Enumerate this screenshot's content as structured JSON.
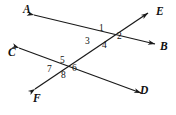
{
  "diagram": {
    "type": "geometry-two-transversal-intersections",
    "background_color": "#ffffff",
    "line_color": "#1a1a1a",
    "text_color": "#111111",
    "width": 176,
    "height": 115,
    "point_labels": [
      {
        "id": "A",
        "text": "A",
        "x": 23,
        "y": 4
      },
      {
        "id": "E",
        "text": "E",
        "x": 156,
        "y": 6
      },
      {
        "id": "B",
        "text": "B",
        "x": 160,
        "y": 41
      },
      {
        "id": "C",
        "text": "C",
        "x": 8,
        "y": 47
      },
      {
        "id": "F",
        "text": "F",
        "x": 33,
        "y": 93
      },
      {
        "id": "D",
        "text": "D",
        "x": 140,
        "y": 85
      }
    ],
    "angle_labels": [
      {
        "id": "1",
        "text": "1",
        "x": 99,
        "y": 24
      },
      {
        "id": "2",
        "text": "2",
        "x": 117,
        "y": 32
      },
      {
        "id": "3",
        "text": "3",
        "x": 85,
        "y": 37
      },
      {
        "id": "4",
        "text": "4",
        "x": 102,
        "y": 41
      },
      {
        "id": "5",
        "text": "5",
        "x": 60,
        "y": 56
      },
      {
        "id": "6",
        "text": "6",
        "x": 72,
        "y": 64
      },
      {
        "id": "7",
        "text": "7",
        "x": 47,
        "y": 65
      },
      {
        "id": "8",
        "text": "8",
        "x": 61,
        "y": 71
      }
    ],
    "lines": [
      {
        "id": "line-AB",
        "from": "A",
        "to": "B",
        "double_headed": true
      },
      {
        "id": "line-CD",
        "from": "C",
        "to": "D",
        "double_headed": true
      },
      {
        "id": "line-FE",
        "from": "F",
        "to": "E",
        "double_headed": true
      }
    ],
    "intersections": [
      {
        "id": "upper",
        "lines": [
          "line-AB",
          "line-FE"
        ],
        "x": 105,
        "y": 33,
        "angles": [
          "1",
          "2",
          "3",
          "4"
        ]
      },
      {
        "id": "lower",
        "lines": [
          "line-CD",
          "line-FE"
        ],
        "x": 66,
        "y": 63,
        "angles": [
          "5",
          "6",
          "7",
          "8"
        ]
      }
    ]
  }
}
